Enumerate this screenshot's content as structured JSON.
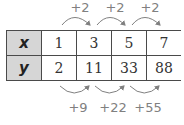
{
  "table": {
    "rows": [
      {
        "header": "x",
        "values": [
          "1",
          "3",
          "5",
          "7"
        ]
      },
      {
        "header": "y",
        "values": [
          "2",
          "11",
          "33",
          "88"
        ]
      }
    ]
  },
  "top_differences": [
    "+2",
    "+2",
    "+2"
  ],
  "bottom_differences": [
    "+9",
    "+22",
    "+55"
  ],
  "colors": {
    "header_fill": "#d6d6d6",
    "border": "#4a4a4a",
    "annotation": "#808080"
  }
}
